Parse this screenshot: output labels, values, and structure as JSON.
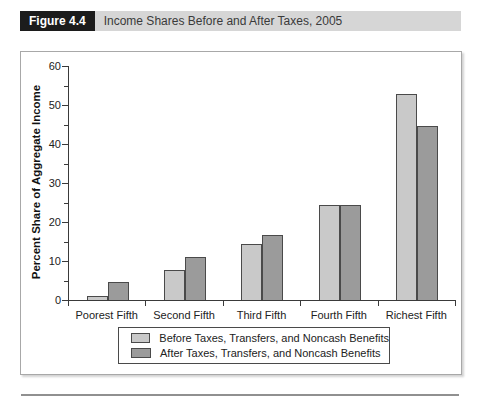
{
  "header": {
    "figure_label": "Figure 4.4",
    "title": "Income Shares Before and After Taxes, 2005"
  },
  "chart_data": {
    "type": "bar",
    "title": "Income Shares Before and After Taxes, 2005",
    "categories": [
      "Poorest Fifth",
      "Second Fifth",
      "Third Fifth",
      "Fourth Fifth",
      "Richest Fifth"
    ],
    "series": [
      {
        "name": "Before Taxes, Transfers, and Noncash Benefits",
        "color": "#c9c9c9",
        "values": [
          1.1,
          7.7,
          14.4,
          24.4,
          52.9
        ]
      },
      {
        "name": "After Taxes, Transfers, and Noncash Benefits",
        "color": "#9b9b9b",
        "values": [
          4.5,
          10.9,
          16.6,
          24.3,
          44.6
        ]
      }
    ],
    "xlabel": "",
    "ylabel": "Percent Share of Aggregate Income",
    "ylim": [
      0,
      60
    ],
    "yticks": [
      0,
      10,
      20,
      30,
      40,
      50,
      60
    ],
    "minor_tick_step": 5,
    "grid": false,
    "legend_position": "bottom"
  },
  "colors": {
    "header_label_bg": "#1c1c1c",
    "header_label_text": "#ffffff",
    "header_bar_bg": "#d6d6d6",
    "panel_border": "#a8a8a8",
    "axis": "#3a3a3a",
    "bar_border": "#4a4a4a",
    "text": "#222222",
    "bottom_rule": "#909090"
  }
}
